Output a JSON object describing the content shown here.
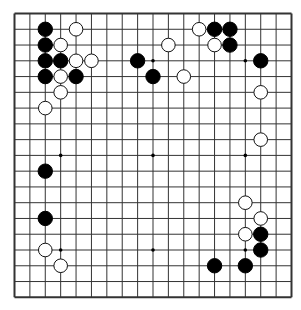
{
  "game": "go",
  "board": {
    "size": 19,
    "line_color": "#333333",
    "background_color": "#ffffff",
    "star_points": [
      [
        3,
        3
      ],
      [
        9,
        3
      ],
      [
        15,
        3
      ],
      [
        3,
        9
      ],
      [
        9,
        9
      ],
      [
        15,
        9
      ],
      [
        3,
        15
      ],
      [
        9,
        15
      ],
      [
        15,
        15
      ]
    ]
  },
  "stones": {
    "black_color": "#000000",
    "white_color": "#ffffff",
    "black": [
      [
        2,
        1
      ],
      [
        13,
        1
      ],
      [
        14,
        1
      ],
      [
        2,
        2
      ],
      [
        14,
        2
      ],
      [
        2,
        3
      ],
      [
        3,
        3
      ],
      [
        8,
        3
      ],
      [
        16,
        3
      ],
      [
        2,
        4
      ],
      [
        4,
        4
      ],
      [
        9,
        4
      ],
      [
        2,
        10
      ],
      [
        2,
        13
      ],
      [
        16,
        14
      ],
      [
        16,
        15
      ],
      [
        13,
        16
      ],
      [
        15,
        16
      ]
    ],
    "white": [
      [
        4,
        1
      ],
      [
        12,
        1
      ],
      [
        3,
        2
      ],
      [
        10,
        2
      ],
      [
        13,
        2
      ],
      [
        4,
        3
      ],
      [
        5,
        3
      ],
      [
        3,
        4
      ],
      [
        11,
        4
      ],
      [
        3,
        5
      ],
      [
        16,
        5
      ],
      [
        2,
        6
      ],
      [
        16,
        8
      ],
      [
        15,
        12
      ],
      [
        16,
        13
      ],
      [
        15,
        14
      ],
      [
        2,
        15
      ],
      [
        3,
        16
      ]
    ]
  }
}
